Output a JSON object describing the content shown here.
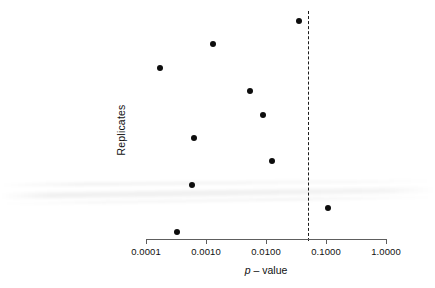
{
  "chart_data": {
    "type": "scatter",
    "title": "",
    "subtitle": "",
    "xlabel": "p – value",
    "xlabel_italic_part": "p",
    "xlabel_rest": " – value",
    "ylabel": "Replicates",
    "x_scale": "log10",
    "xlim": [
      0.0001,
      1.0
    ],
    "grid": false,
    "legend": null,
    "xticks": [
      {
        "value": 0.0001,
        "label": "0.0001"
      },
      {
        "value": 0.001,
        "label": "0.0010"
      },
      {
        "value": 0.01,
        "label": "0.0100"
      },
      {
        "value": 0.1,
        "label": "0.1000"
      },
      {
        "value": 1.0,
        "label": "1.0000"
      }
    ],
    "yticks": [],
    "series": [
      {
        "name": "Replicate p-values",
        "marker": "filled-circle",
        "color": "#0d0d0d",
        "points": [
          {
            "replicate": 1,
            "p_value": 0.035
          },
          {
            "replicate": 2,
            "p_value": 0.0013
          },
          {
            "replicate": 3,
            "p_value": 0.00017
          },
          {
            "replicate": 4,
            "p_value": 0.0054
          },
          {
            "replicate": 5,
            "p_value": 0.0089
          },
          {
            "replicate": 6,
            "p_value": 0.00063
          },
          {
            "replicate": 7,
            "p_value": 0.0126
          },
          {
            "replicate": 8,
            "p_value": 0.00058
          },
          {
            "replicate": 9,
            "p_value": 0.108
          },
          {
            "replicate": 10,
            "p_value": 0.00033
          }
        ]
      }
    ],
    "annotations": [
      {
        "name": "significance-threshold",
        "type": "vline",
        "value": 0.05,
        "style": "dashed",
        "color": "#1a1a1a",
        "label": ""
      }
    ]
  },
  "axis": {
    "x_tick_labels": [
      "0.0001",
      "0.0010",
      "0.0100",
      "0.1000",
      "1.0000"
    ],
    "x_title_italic": "p",
    "x_title_rest": " – value",
    "y_title": "Replicates"
  }
}
